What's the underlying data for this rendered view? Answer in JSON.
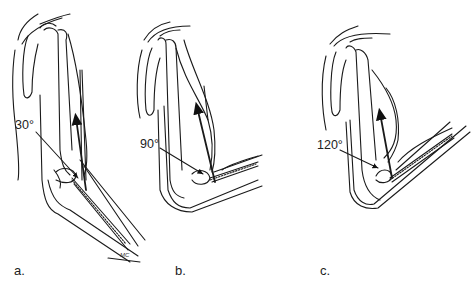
{
  "figure": {
    "panels": [
      {
        "id": "a",
        "label": "a.",
        "angle": "30°"
      },
      {
        "id": "b",
        "label": "b.",
        "angle": "90°"
      },
      {
        "id": "c",
        "label": "c.",
        "angle": "120°"
      }
    ],
    "signature": "MC"
  }
}
